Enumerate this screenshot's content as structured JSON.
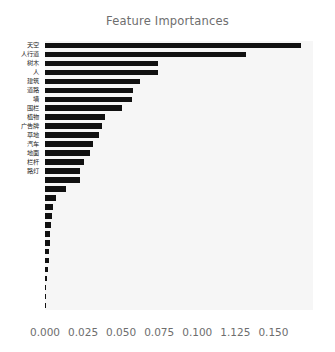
{
  "chart_data": {
    "type": "bar",
    "orientation": "horizontal",
    "title": "Feature Importances",
    "xlabel": "",
    "ylabel": "",
    "xlim": [
      0.0,
      0.176
    ],
    "xticks": [
      "0.000",
      "0.025",
      "0.050",
      "0.075",
      "0.100",
      "1.125",
      "0.150"
    ],
    "xtick_values": [
      0.0,
      0.025,
      0.05,
      0.075,
      0.1,
      0.125,
      0.15
    ],
    "grid": false,
    "legend": null,
    "bar_color": "#111111",
    "plot_background": "#f6f6f6",
    "categories": [
      "天空",
      "人行道",
      "树木",
      "人",
      "建筑",
      "道路",
      "墙",
      "围栏",
      "植物",
      "广告牌",
      "草地",
      "汽车",
      "地面",
      "栏杆",
      "路灯",
      "",
      "",
      "",
      "",
      "",
      "",
      "",
      "",
      "",
      "",
      "",
      "",
      "",
      "",
      ""
    ],
    "values": [
      0.168,
      0.132,
      0.0745,
      0.0742,
      0.0625,
      0.0575,
      0.0572,
      0.0505,
      0.0395,
      0.0375,
      0.0352,
      0.0312,
      0.0298,
      0.0258,
      0.0232,
      0.0228,
      0.0138,
      0.0072,
      0.0055,
      0.0045,
      0.0042,
      0.0034,
      0.0031,
      0.0028,
      0.0025,
      0.0018,
      0.0013,
      0.0009,
      0.0006,
      0.0004
    ]
  }
}
